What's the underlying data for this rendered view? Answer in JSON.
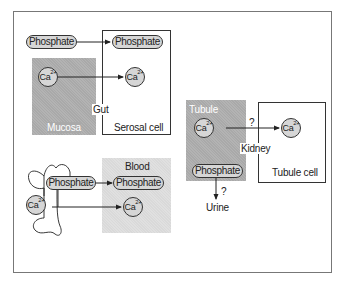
{
  "diagram": {
    "gut": {
      "label": "Gut",
      "mucosa_label": "Mucosa",
      "serosal_label": "Serosal cell",
      "phosphate_source": "Phosphate",
      "phosphate_target": "Phosphate",
      "calcium_source": "Ca",
      "calcium_target": "Ca",
      "charge": "2+"
    },
    "kidney": {
      "label": "Kidney",
      "tubule_label": "Tubule",
      "tubule_cell_label": "Tubule cell",
      "calcium_source": "Ca",
      "calcium_target": "Ca",
      "charge": "2+",
      "phosphate": "Phosphate",
      "calcium_question": "?",
      "phosphate_question": "?",
      "urine_label": "Urine"
    },
    "bone": {
      "phosphate": "Phosphate",
      "calcium": "Ca",
      "charge": "2+",
      "blood_label": "Blood",
      "blood_phosphate": "Phosphate",
      "blood_calcium": "Ca"
    },
    "colors": {
      "dark_fill": "#a9a9a9",
      "light_fill": "#d9d9d9",
      "pill_fill": "#d6d6d6",
      "stroke": "#333333"
    }
  }
}
